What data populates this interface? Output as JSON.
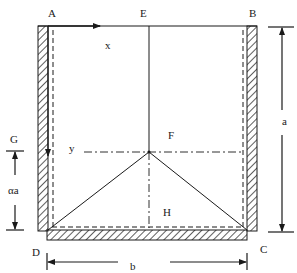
{
  "diagram": {
    "type": "rectangular plate / tank cross-section with yield-line pattern",
    "colors": {
      "line": "#1a1a1a",
      "background": "#ffffff"
    },
    "points": {
      "A": "A",
      "B": "B",
      "C": "C",
      "D": "D",
      "E": "E",
      "F": "F",
      "G": "G",
      "H": "H"
    },
    "axes": {
      "x": "x",
      "y": "y"
    },
    "dimensions": {
      "height": "a",
      "width": "b",
      "partial_height": "αa"
    },
    "edges": {
      "left": "hatched (fixed support)",
      "right": "hatched (fixed support)",
      "bottom": "hatched (fixed support)",
      "top": "free edge"
    }
  }
}
